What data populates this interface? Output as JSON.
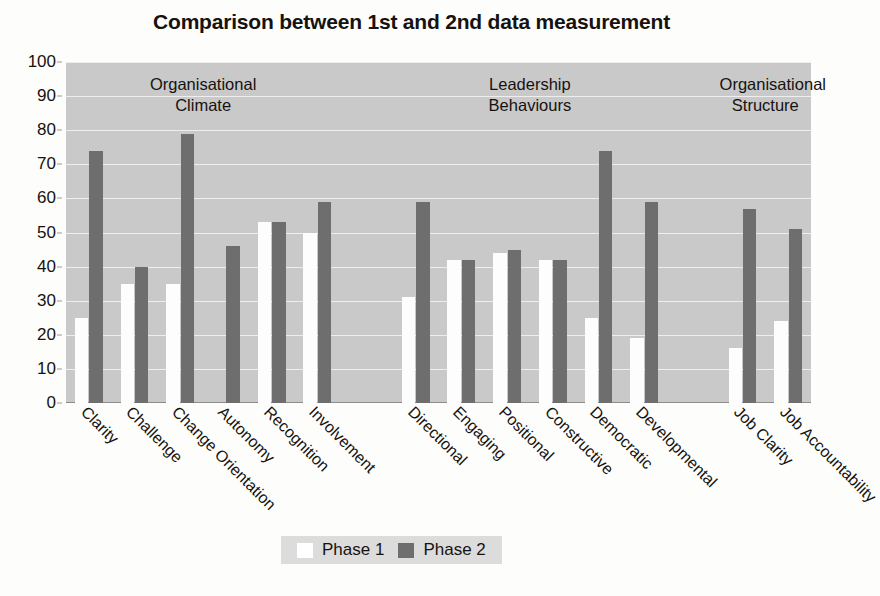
{
  "chart_data": {
    "type": "bar",
    "title": "Comparison between 1st and 2nd data measurement",
    "xlabel": "",
    "ylabel": "",
    "ylim": [
      0,
      100
    ],
    "yticks": [
      0,
      10,
      20,
      30,
      40,
      50,
      60,
      70,
      80,
      90,
      100
    ],
    "grid": true,
    "legend_position": "bottom",
    "categories": [
      "Clarity",
      "Challenge",
      "Change Orientation",
      "Autonomy",
      "Recognition",
      "Involvement",
      "Directional",
      "Engaging",
      "Positional",
      "Constructive",
      "Democratic",
      "Developmental",
      "Job Clarity",
      "Job Accountability"
    ],
    "series": [
      {
        "name": "Phase 1",
        "color": "#ffffff",
        "values": [
          25,
          35,
          35,
          0,
          53,
          50,
          31,
          42,
          44,
          42,
          25,
          19,
          16,
          24
        ]
      },
      {
        "name": "Phase 2",
        "color": "#6e6e6e",
        "values": [
          74,
          40,
          79,
          46,
          53,
          59,
          59,
          42,
          45,
          42,
          74,
          59,
          57,
          51
        ]
      }
    ],
    "groups": [
      {
        "label": "Organisational\nClimate",
        "categories": [
          "Clarity",
          "Challenge",
          "Change Orientation",
          "Autonomy",
          "Recognition",
          "Involvement"
        ]
      },
      {
        "label": "Leadership\nBehaviours",
        "categories": [
          "Directional",
          "Engaging",
          "Positional",
          "Constructive",
          "Democratic",
          "Developmental"
        ]
      },
      {
        "label": "Organisational\nStructure",
        "categories": [
          "Job Clarity",
          "Job Accountability"
        ]
      }
    ],
    "colors": {
      "plot_background": "#c9c9c9",
      "gridline": "#eeeeee",
      "phase1": "#ffffff",
      "phase2": "#6e6e6e",
      "text": "#16120f",
      "legend_background": "#dcdcdc"
    }
  },
  "legend": {
    "items": [
      {
        "label": "Phase 1",
        "swatch": "phase1-swatch"
      },
      {
        "label": "Phase 2",
        "swatch": "phase2-swatch"
      }
    ]
  },
  "group_headers": [
    {
      "line1": "Organisational",
      "line2": "Climate"
    },
    {
      "line1": "Leadership",
      "line2": "Behaviours"
    },
    {
      "line1": "Organisational",
      "line2": "Structure"
    }
  ]
}
